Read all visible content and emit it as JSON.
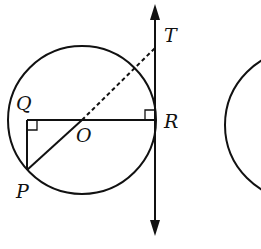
{
  "diagram": {
    "type": "geometry",
    "labels": {
      "T": "T",
      "Q": "Q",
      "O": "O",
      "R": "R",
      "P": "P"
    },
    "points": {
      "O": [
        82,
        120
      ],
      "Q": [
        27,
        120
      ],
      "R": [
        155,
        120
      ],
      "P": [
        27,
        170
      ],
      "T": [
        155,
        48
      ]
    },
    "circle": {
      "center": [
        82,
        120
      ],
      "radius": 74
    },
    "second_circle_partial": {
      "center": [
        300,
        125
      ],
      "radius": 75
    },
    "tangent_line": {
      "x": 155,
      "y_top": 4,
      "y_bottom": 236,
      "arrows": "both"
    },
    "segments": [
      {
        "from": "Q",
        "to": "R",
        "style": "solid"
      },
      {
        "from": "Q",
        "to": "P",
        "style": "solid"
      },
      {
        "from": "P",
        "to": "O",
        "style": "solid"
      },
      {
        "from": "O",
        "to": "T",
        "style": "dashed"
      }
    ],
    "right_angles": [
      "Q",
      "R"
    ],
    "stroke_color": "#111111"
  }
}
